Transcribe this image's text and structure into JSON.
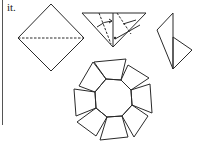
{
  "caption": {
    "text": "it."
  },
  "figures": [
    {
      "name": "square-diamond-fold",
      "description": "Square rotated as a diamond with a dashed horizontal fold line"
    },
    {
      "name": "triangle-fold",
      "description": "Triangle with solid center line, dashed fold lines and a curved arrow"
    },
    {
      "name": "folded-unit",
      "description": "Narrow folded unit with two triangular flaps"
    },
    {
      "name": "octagonal-ring",
      "description": "Eight-unit modular ring forming a pinwheel around an octagon"
    }
  ],
  "colors": {
    "line": "#2a2a2a",
    "background": "#ffffff"
  }
}
